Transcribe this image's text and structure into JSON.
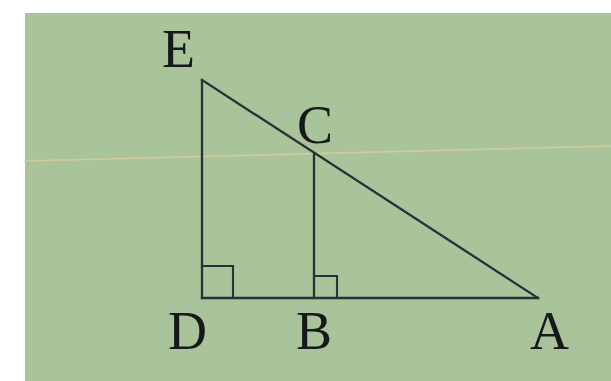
{
  "figure": {
    "background_color": "#a9c49b",
    "margin_color": "#ffffff",
    "ink_color": "#2b2f36",
    "label_color": "#16181a",
    "scan_line_color": "#d8cb9a",
    "paper": {
      "left": 25,
      "top": 13,
      "width": 586,
      "height": 368
    }
  },
  "points": {
    "E": {
      "label": "E",
      "x": 202,
      "y": 80
    },
    "C": {
      "label": "C",
      "x": 314,
      "y": 154
    },
    "D": {
      "label": "D",
      "x": 202,
      "y": 298
    },
    "B": {
      "label": "B",
      "x": 314,
      "y": 298
    },
    "A": {
      "label": "A",
      "x": 538,
      "y": 298
    }
  },
  "labels": [
    {
      "name": "vertex-label-e",
      "text": "E",
      "left": 162,
      "top": 22,
      "size": 54
    },
    {
      "name": "vertex-label-c",
      "text": "C",
      "left": 297,
      "top": 98,
      "size": 54
    },
    {
      "name": "vertex-label-d",
      "text": "D",
      "left": 168,
      "top": 304,
      "size": 54
    },
    {
      "name": "vertex-label-b",
      "text": "B",
      "left": 296,
      "top": 304,
      "size": 54
    },
    {
      "name": "vertex-label-a",
      "text": "A",
      "left": 530,
      "top": 304,
      "size": 54
    }
  ],
  "segments": [
    {
      "name": "segment-ed",
      "from": "E",
      "to": "D",
      "d": "M 202 80 L 202 298"
    },
    {
      "name": "segment-ea",
      "from": "E",
      "to": "A",
      "d": "M 202 80 L 538 298"
    },
    {
      "name": "segment-da",
      "from": "D",
      "to": "A",
      "d": "M 202 298 L 538 298"
    },
    {
      "name": "segment-cb",
      "from": "C",
      "to": "B",
      "d": "M 314 154 L 314 298"
    }
  ],
  "right_angle_marks": [
    {
      "name": "right-angle-mark-d",
      "at": "D",
      "d": "M 202 266 L 233 266 L 233 298",
      "size": 32
    },
    {
      "name": "right-angle-mark-b",
      "at": "B",
      "d": "M 314 276 L 337 276 L 337 298",
      "size": 22
    }
  ],
  "scan_artifact": {
    "name": "scan-line-artifact",
    "d": "M 25 161 L 611 146"
  }
}
